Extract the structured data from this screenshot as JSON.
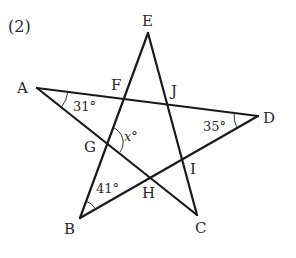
{
  "problem": {
    "number_label": "(2)"
  },
  "figure": {
    "type": "pentagram",
    "line_color": "#1a1a1a",
    "vertices": {
      "A": {
        "label": "A",
        "x": 37,
        "y": 88
      },
      "B": {
        "label": "B",
        "x": 80,
        "y": 218
      },
      "C": {
        "label": "C",
        "x": 197,
        "y": 215
      },
      "D": {
        "label": "D",
        "x": 258,
        "y": 116
      },
      "E": {
        "label": "E",
        "x": 148,
        "y": 33
      }
    },
    "intersections": {
      "F": {
        "label": "F",
        "x": 122,
        "y": 97
      },
      "G": {
        "label": "G",
        "x": 107,
        "y": 143
      },
      "H": {
        "label": "H",
        "x": 150,
        "y": 177
      },
      "I": {
        "label": "I",
        "x": 183,
        "y": 160
      },
      "J": {
        "label": "J",
        "x": 166,
        "y": 103
      }
    },
    "segments": [
      {
        "from": "A",
        "to": "D"
      },
      {
        "from": "A",
        "to": "C"
      },
      {
        "from": "E",
        "to": "B"
      },
      {
        "from": "E",
        "to": "C"
      },
      {
        "from": "B",
        "to": "D"
      }
    ],
    "angles": {
      "at_A": {
        "vertex": "A",
        "value": "31°"
      },
      "at_D": {
        "vertex": "D",
        "value": "35°"
      },
      "at_B": {
        "vertex": "B",
        "value": "41°"
      },
      "at_G": {
        "vertex": "G",
        "value_var": "x",
        "value_unit": "°"
      }
    }
  }
}
